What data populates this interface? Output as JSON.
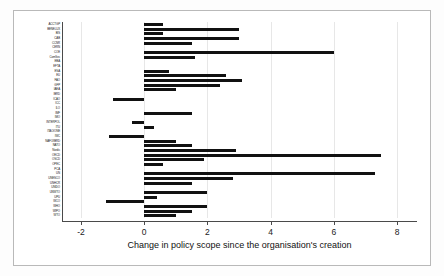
{
  "chart_data": {
    "type": "bar",
    "orientation": "horizontal",
    "title": "",
    "xlabel": "Change in policy scope since the organisation's creation",
    "ylabel": "",
    "xlim": [
      -2.6,
      8.6
    ],
    "ylim": [
      0,
      47
    ],
    "grid": true,
    "grid_axis": "x",
    "legend": "none",
    "xticks": [
      -2,
      0,
      2,
      4,
      6,
      8
    ],
    "xticklabels": [
      "-2",
      "0",
      "2",
      "4",
      "6",
      "8"
    ],
    "bar_color": "#111111",
    "categories": [
      "ACCTGP",
      "BENELUX",
      "BIS",
      "CAB",
      "CCNR",
      "CERN",
      "COE",
      "ComSec",
      "EBA",
      "EFTA",
      "ESA",
      "EU",
      "FAO",
      "GFP",
      "IAEA",
      "IBRD",
      "ICAO",
      "ICC",
      "ILO",
      "IMF",
      "IMO",
      "INTERPOL",
      "ITU",
      "ITAO/ONE",
      "IWC",
      "NAFO/IBRD",
      "NATO",
      "Nordic",
      "OECD",
      "OSCD",
      "OPEC",
      "PCA",
      "UN",
      "UNESCO",
      "UNHCR",
      "UNIDO",
      "UNWTO",
      "UPU",
      "WCO",
      "WHO",
      "WIPO",
      "WTO"
    ],
    "values": [
      0.6,
      3.0,
      0.6,
      3.0,
      1.5,
      6.0,
      1.6,
      3.0,
      0.0,
      0.0,
      0.8,
      2.6,
      3.1,
      2.4,
      1.0,
      0.0,
      -1.0,
      0.0,
      1.5,
      -0.4,
      0.3,
      -1.1,
      0.0,
      1.0,
      1.5,
      2.9,
      7.5,
      1.9,
      0.6,
      0.0,
      0.0,
      2.8,
      1.5,
      0.0,
      7.3,
      2.0,
      1.4,
      0.8,
      0.0,
      0.4,
      -1.2,
      1.5
    ],
    "bars": [
      {
        "label": "ACCTGP",
        "value": 0.6
      },
      {
        "label": "BENELUX",
        "value": 3.0
      },
      {
        "label": "BIS",
        "value": 0.6
      },
      {
        "label": "CAB",
        "value": 3.0
      },
      {
        "label": "CCNR",
        "value": 1.5
      },
      {
        "label": "CERN",
        "value": 0.0
      },
      {
        "label": "COE",
        "value": 6.0
      },
      {
        "label": "ComSec",
        "value": 1.6
      },
      {
        "label": "EBA",
        "value": 0.0
      },
      {
        "label": "EFTA",
        "value": 0.0
      },
      {
        "label": "ESA",
        "value": 0.8
      },
      {
        "label": "EU",
        "value": 2.6
      },
      {
        "label": "FAO",
        "value": 3.1
      },
      {
        "label": "GFP",
        "value": 2.4
      },
      {
        "label": "IAEA",
        "value": 1.0
      },
      {
        "label": "IBRD",
        "value": 0.0
      },
      {
        "label": "ICAO",
        "value": -1.0
      },
      {
        "label": "ICC",
        "value": 0.0
      },
      {
        "label": "ILO",
        "value": 0.0
      },
      {
        "label": "IMF",
        "value": 1.5
      },
      {
        "label": "IMO",
        "value": 0.0
      },
      {
        "label": "INTERPOL",
        "value": -0.4
      },
      {
        "label": "ITU",
        "value": 0.3
      },
      {
        "label": "ITAO/ONE",
        "value": 0.0
      },
      {
        "label": "IWC",
        "value": -1.1
      },
      {
        "label": "NAFO/IBRD",
        "value": 1.0
      },
      {
        "label": "NATO",
        "value": 1.5
      },
      {
        "label": "Nordic",
        "value": 2.9
      },
      {
        "label": "OECD",
        "value": 7.5
      },
      {
        "label": "OSCD",
        "value": 1.9
      },
      {
        "label": "OPEC",
        "value": 0.6
      },
      {
        "label": "PCA",
        "value": 0.0
      },
      {
        "label": "UN",
        "value": 7.3
      },
      {
        "label": "UNESCO",
        "value": 2.8
      },
      {
        "label": "UNHCR",
        "value": 1.5
      },
      {
        "label": "UNIDO",
        "value": 0.0
      },
      {
        "label": "UNWTO",
        "value": 2.0
      },
      {
        "label": "UPU",
        "value": 0.4
      },
      {
        "label": "WCO",
        "value": -1.2
      },
      {
        "label": "WHO",
        "value": 2.0
      },
      {
        "label": "WIPO",
        "value": 1.5
      },
      {
        "label": "WTO",
        "value": 1.0
      }
    ]
  }
}
